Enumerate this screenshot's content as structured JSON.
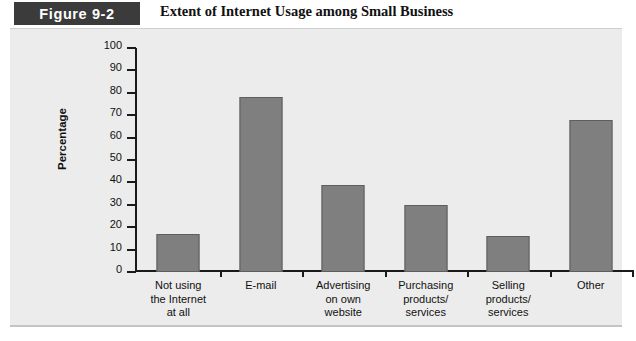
{
  "figure": {
    "tag": "Figure 9-2",
    "title": "Extent of Internet Usage among Small Business"
  },
  "colors": {
    "tag_background": "#3b3b3b",
    "panel_background": "#ececec",
    "bar_fill": "#7f7f7f",
    "bar_border": "#5e5e5e",
    "axis": "#1a1a1a"
  },
  "chart_data": {
    "type": "bar",
    "title": "Extent of Internet Usage among Small Business",
    "xlabel": "",
    "ylabel": "Percentage",
    "ylim": [
      0,
      100
    ],
    "ytick_step": 10,
    "grid": false,
    "legend": null,
    "categories": [
      "Not using\nthe Internet\nat all",
      "E-mail",
      "Advertising\non own\nwebsite",
      "Purchasing\nproducts/\nservices",
      "Selling\nproducts/\nservices",
      "Other"
    ],
    "category_lines": [
      [
        "Not using",
        "the Internet",
        "at all"
      ],
      [
        "E-mail"
      ],
      [
        "Advertising",
        "on own",
        "website"
      ],
      [
        "Purchasing",
        "products/",
        "services"
      ],
      [
        "Selling",
        "products/",
        "services"
      ],
      [
        "Other"
      ]
    ],
    "values": [
      17,
      78,
      39,
      30,
      16,
      68
    ],
    "ytick_labels": [
      "100",
      "90",
      "80",
      "70",
      "60",
      "50",
      "40",
      "30",
      "20",
      "10",
      "0"
    ]
  }
}
